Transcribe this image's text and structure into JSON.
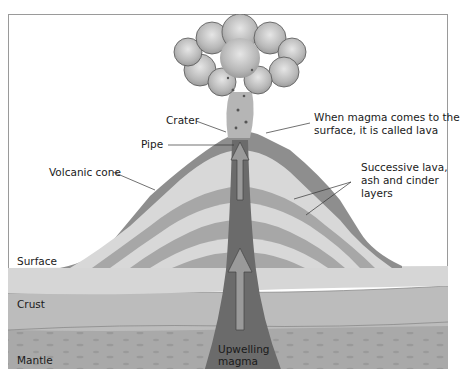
{
  "diagram": {
    "type": "labeled-cross-section",
    "labels": {
      "crater": "Crater",
      "pipe": "Pipe",
      "lava_note_line1": "When magma comes to the",
      "lava_note_line2": "surface, it is called lava",
      "volcanic_cone": "Volcanic cone",
      "layers_line1": "Successive lava,",
      "layers_line2": "ash and cinder",
      "layers_line3": "layers",
      "surface": "Surface",
      "crust": "Crust",
      "mantle": "Mantle",
      "upwelling_line1": "Upwelling",
      "upwelling_line2": "magma"
    },
    "colors": {
      "frame": "#9a9a9a",
      "cloud": "#bdbdbd",
      "cone_outer": "#8c8c8c",
      "cone_band_light": "#d6d6d6",
      "cone_band_dark": "#a6a6a6",
      "surface_layer": "#d4d4d4",
      "crust_layer": "#bcbcbc",
      "mantle_layer": "#a8a8a8",
      "magma_pipe": "#6a6a6a",
      "arrow": "#9a9a9a"
    }
  }
}
